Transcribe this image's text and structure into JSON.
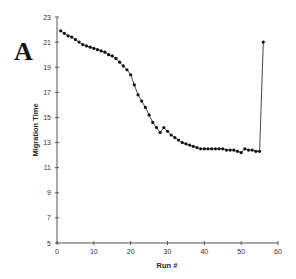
{
  "panel_label": "A",
  "chart_data": {
    "type": "line",
    "title": "",
    "xlabel": "Run #",
    "ylabel": "Migration Time",
    "xlim": [
      0,
      60
    ],
    "ylim": [
      5,
      23
    ],
    "xticks": [
      0,
      10,
      20,
      30,
      40,
      50,
      60
    ],
    "yticks": [
      5,
      7,
      9,
      11,
      13,
      15,
      17,
      19,
      21,
      23
    ],
    "grid": false,
    "legend": null,
    "series": [
      {
        "name": "Migration Time",
        "marker": "circle",
        "color": "#111111",
        "x": [
          1,
          2,
          3,
          4,
          5,
          6,
          7,
          8,
          9,
          10,
          11,
          12,
          13,
          14,
          15,
          16,
          17,
          18,
          19,
          20,
          21,
          22,
          23,
          24,
          25,
          26,
          27,
          28,
          29,
          30,
          31,
          32,
          33,
          34,
          35,
          36,
          37,
          38,
          39,
          40,
          41,
          42,
          43,
          44,
          45,
          46,
          47,
          48,
          49,
          50,
          51,
          52,
          53,
          54,
          55,
          56
        ],
        "y": [
          21.9,
          21.7,
          21.5,
          21.4,
          21.2,
          21.0,
          20.8,
          20.7,
          20.6,
          20.5,
          20.4,
          20.3,
          20.2,
          20.0,
          19.9,
          19.7,
          19.4,
          19.1,
          18.8,
          18.4,
          17.6,
          16.8,
          16.3,
          15.8,
          15.2,
          14.6,
          14.2,
          13.8,
          14.2,
          13.9,
          13.6,
          13.4,
          13.2,
          13.0,
          12.9,
          12.8,
          12.7,
          12.6,
          12.5,
          12.5,
          12.5,
          12.5,
          12.5,
          12.5,
          12.5,
          12.4,
          12.4,
          12.4,
          12.3,
          12.2,
          12.5,
          12.4,
          12.4,
          12.3,
          12.3,
          21.0
        ]
      }
    ]
  }
}
